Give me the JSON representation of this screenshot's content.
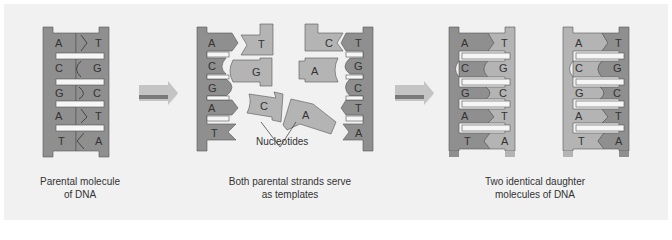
{
  "colors": {
    "background": "#f1f1f1",
    "strand_dark": "#8f8f8f",
    "strand_light": "#b4b4b4",
    "strand_outline": "#555555",
    "rung": "#f6f6f6",
    "arrow_light": "#c4c4c4",
    "arrow_dark": "#7a7a7a"
  },
  "stages": [
    {
      "id": "parental",
      "caption_line1": "Parental molecule",
      "caption_line2": "of DNA",
      "left_bases": [
        "A",
        "C",
        "G",
        "A",
        "T"
      ],
      "right_bases": [
        "T",
        "G",
        "C",
        "T",
        "A"
      ]
    },
    {
      "id": "separation",
      "caption_line1": "Both parental strands serve",
      "caption_line2": "as templates",
      "left_strand_bases": [
        "A",
        "C",
        "G",
        "A",
        "T"
      ],
      "right_strand_bases": [
        "T",
        "G",
        "C",
        "T",
        "A"
      ],
      "free_nucleotides": [
        "T",
        "G",
        "C",
        "A",
        "C",
        "A"
      ],
      "nucleotides_label": "Nucleotides"
    },
    {
      "id": "daughters",
      "caption_line1": "Two identical daughter",
      "caption_line2": "molecules of DNA",
      "left_bases": [
        "A",
        "C",
        "G",
        "A",
        "T"
      ],
      "right_bases": [
        "T",
        "G",
        "C",
        "T",
        "A"
      ]
    }
  ],
  "arrows": [
    "process-arrow-1",
    "process-arrow-2"
  ]
}
